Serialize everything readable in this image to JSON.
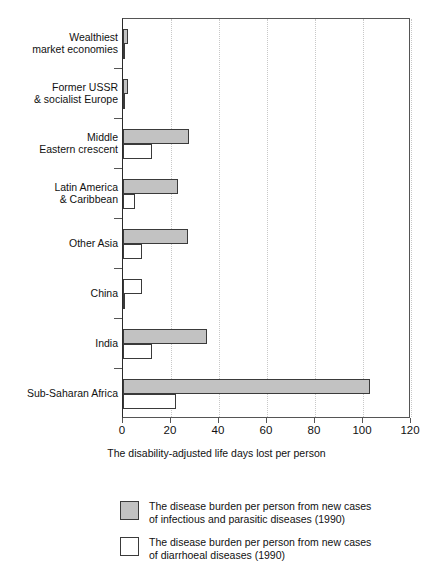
{
  "chart_data": {
    "type": "bar",
    "orientation": "horizontal",
    "title": "",
    "xlabel": "The disability-adjusted life days lost per person",
    "ylabel": "",
    "xlim": [
      0,
      120
    ],
    "xticks": [
      0,
      20,
      40,
      60,
      80,
      100,
      120
    ],
    "grid": "vertical-dotted",
    "legend_position": "bottom",
    "categories": [
      "Wealthiest\nmarket economies",
      "Former USSR\n& socialist Europe",
      "Middle\nEastern crescent",
      "Latin America\n& Caribbean",
      "Other Asia",
      "China",
      "India",
      "Sub-Saharan Africa"
    ],
    "series": [
      {
        "name": "The disease burden per person from new cases of infectious and parasitic diseases (1990)",
        "color": "#c2c2c2",
        "values": [
          2,
          2,
          27.5,
          23,
          27,
          1,
          35,
          103
        ]
      },
      {
        "name": "The disease burden per person from new cases of diarrhoeal diseases (1990)",
        "color": "#ffffff",
        "values": [
          0.4,
          0.4,
          12,
          5,
          8,
          8,
          12,
          22
        ]
      }
    ]
  },
  "axis": {
    "x_title": "The disability-adjusted life days lost per person",
    "tick_labels": [
      "0",
      "20",
      "40",
      "60",
      "80",
      "100",
      "120"
    ],
    "category_labels": [
      {
        "line1": "Wealthiest",
        "line2": "market economies"
      },
      {
        "line1": "Former USSR",
        "line2": "& socialist Europe"
      },
      {
        "line1": "Middle",
        "line2": "Eastern crescent"
      },
      {
        "line1": "Latin America",
        "line2": "& Caribbean"
      },
      {
        "line1": "Other Asia",
        "line2": ""
      },
      {
        "line1": "China",
        "line2": ""
      },
      {
        "line1": "India",
        "line2": ""
      },
      {
        "line1": "Sub-Saharan Africa",
        "line2": ""
      }
    ]
  },
  "legend": {
    "items": [
      {
        "swatch": "infectious",
        "line1": "The disease burden per person from new cases",
        "line2": "of infectious and parasitic diseases (1990)"
      },
      {
        "swatch": "diarrhoeal",
        "line1": "The disease burden per person from new cases",
        "line2": "of diarrhoeal diseases (1990)"
      }
    ]
  },
  "colors": {
    "infectious_fill": "#c2c2c2",
    "diarrhoeal_fill": "#ffffff",
    "bar_stroke": "#3a3a3a",
    "axis": "#555555",
    "gridline": "#c8c8c8",
    "text": "#111111"
  }
}
